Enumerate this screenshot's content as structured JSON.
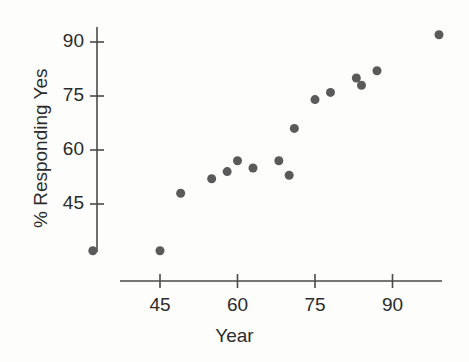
{
  "chart_data": {
    "type": "scatter",
    "title": "",
    "xlabel": "Year",
    "ylabel": "% Responding Yes",
    "xlim": [
      30,
      101
    ],
    "ylim": [
      28,
      96
    ],
    "xticks": [
      45,
      60,
      75,
      90
    ],
    "yticks": [
      45,
      60,
      75,
      90
    ],
    "xtick_labels": [
      "45",
      "60",
      "75",
      "90"
    ],
    "ytick_labels": [
      "45",
      "60",
      "75",
      "90"
    ],
    "grid": false,
    "legend": null,
    "marker": {
      "shape": "circle",
      "color": "#5a5a5a",
      "size": 9
    },
    "axis_color": "#4a4a4a",
    "background": "#fdfdfc",
    "series": [
      {
        "name": "% Responding Yes",
        "x": [
          32,
          45,
          49,
          55,
          58,
          60,
          63,
          68,
          70,
          71,
          75,
          78,
          83,
          84,
          87,
          99
        ],
        "y": [
          32,
          32,
          48,
          52,
          54,
          57,
          55,
          57,
          53,
          66,
          74,
          76,
          80,
          78,
          82,
          92
        ]
      }
    ]
  }
}
